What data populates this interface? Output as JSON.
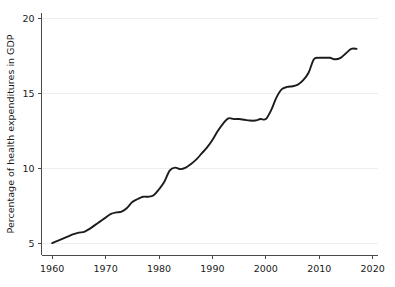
{
  "chart_data": {
    "type": "line",
    "title": "",
    "subtitle": "",
    "xlabel": "",
    "ylabel": "Percentage of health expenditures in GDP",
    "xlim": [
      1958,
      2021
    ],
    "ylim": [
      4.2,
      20.4
    ],
    "xticks": [
      1960,
      1970,
      1980,
      1990,
      2000,
      2010,
      2020
    ],
    "xtick_labels": [
      "1960",
      "1970",
      "1980",
      "1990",
      "2000",
      "2010",
      "2020"
    ],
    "yticks": [
      5,
      10,
      15,
      20
    ],
    "ytick_labels": [
      "5",
      "10",
      "15",
      "20"
    ],
    "grid": "horizontal-faint",
    "legend": "none",
    "line_color": "#1c1c1c",
    "axis_color": "#4a4a4a",
    "grid_color": "#eceef0",
    "series": [
      {
        "name": "Percentage of health expenditures in GDP",
        "x": [
          1960,
          1961,
          1962,
          1963,
          1964,
          1965,
          1966,
          1967,
          1968,
          1969,
          1970,
          1971,
          1972,
          1973,
          1974,
          1975,
          1976,
          1977,
          1978,
          1979,
          1980,
          1981,
          1982,
          1983,
          1984,
          1985,
          1986,
          1987,
          1988,
          1989,
          1990,
          1991,
          1992,
          1993,
          1994,
          1995,
          1996,
          1997,
          1998,
          1999,
          2000,
          2001,
          2002,
          2003,
          2004,
          2005,
          2006,
          2007,
          2008,
          2009,
          2010,
          2011,
          2012,
          2013,
          2014,
          2015,
          2016,
          2017
        ],
        "values": [
          5.0,
          5.15,
          5.3,
          5.45,
          5.6,
          5.7,
          5.75,
          5.95,
          6.2,
          6.45,
          6.7,
          6.95,
          7.05,
          7.1,
          7.35,
          7.75,
          7.95,
          8.1,
          8.1,
          8.2,
          8.6,
          9.1,
          9.85,
          10.05,
          9.95,
          10.05,
          10.3,
          10.6,
          11.0,
          11.4,
          11.9,
          12.5,
          13.0,
          13.35,
          13.3,
          13.3,
          13.25,
          13.2,
          13.2,
          13.3,
          13.3,
          13.9,
          14.75,
          15.3,
          15.45,
          15.5,
          15.6,
          15.9,
          16.4,
          17.3,
          17.4,
          17.4,
          17.4,
          17.3,
          17.4,
          17.7,
          18.0,
          18.0
        ]
      }
    ]
  }
}
